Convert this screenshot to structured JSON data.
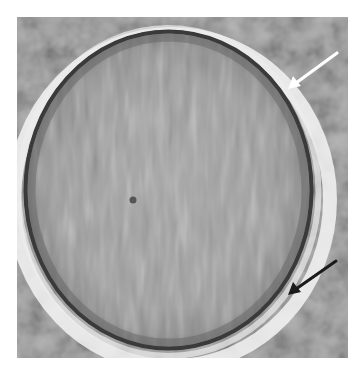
{
  "image": {
    "description": "Grayscale micrograph of a single round cell with a dark outer membrane, with a white arrow at upper right and a black arrow at lower right pointing to the cell edge",
    "colors": {
      "page_background": "#ffffff",
      "field_background": "#a8a8a8",
      "cell_interior": "#9a9a9a",
      "membrane": "#3c3c3c",
      "halo": "#f2f2f2",
      "white_arrow": "#ffffff",
      "black_arrow": "#1a1a1a"
    },
    "annotations": [
      {
        "type": "arrow",
        "color_name": "white",
        "points_to": "upper-right cell membrane"
      },
      {
        "type": "arrow",
        "color_name": "black",
        "points_to": "lower-right cell membrane"
      }
    ]
  }
}
